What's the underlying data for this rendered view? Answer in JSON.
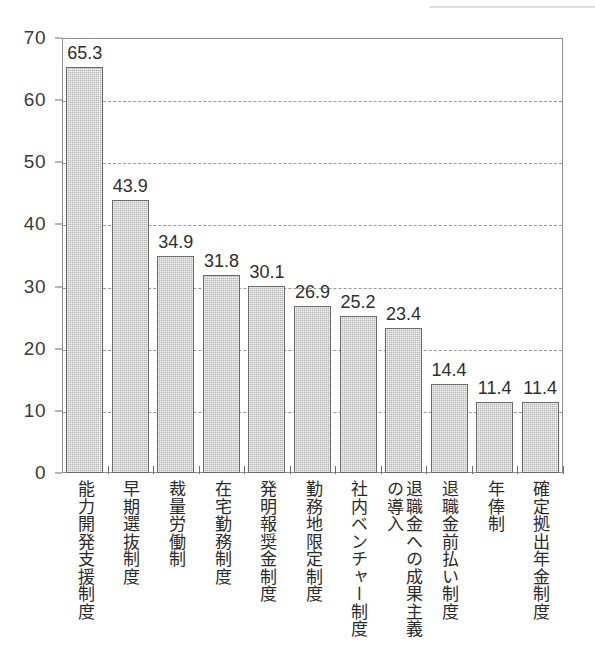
{
  "chart_data": {
    "type": "bar",
    "title": "",
    "subtitle": "",
    "xlabel": "",
    "ylabel": "",
    "ylim": [
      0,
      70
    ],
    "ytick_step": 10,
    "yticks": [
      "70",
      "60",
      "50",
      "40",
      "30",
      "20",
      "10",
      "0"
    ],
    "grid": true,
    "grid_style": "dashed-horizontal",
    "legend": false,
    "legend_position": "none",
    "orientation": "vertical",
    "bar_color": "#b4b4b4",
    "bar_border_color": "#6b6b6b",
    "axis_color": "#8e8e8e",
    "label_color": "#2b2b2b",
    "categories": [
      "能力開発支援制度",
      "早期選抜制度",
      "裁量労働制",
      "在宅勤務制度",
      "発明報奨金制度",
      "勤務地限定制度",
      "社内ベンチャー制度",
      "退職金への成果主義の導入",
      "退職金前払い制度",
      "年俸制",
      "確定拠出年金制度"
    ],
    "category_columns": [
      [
        "能力開発支援制度"
      ],
      [
        "早期選抜制度"
      ],
      [
        "裁量労働制"
      ],
      [
        "在宅勤務制度"
      ],
      [
        "発明報奨金制度"
      ],
      [
        "勤務地限定制度"
      ],
      [
        "社内ベンチャー制度"
      ],
      [
        "退職金への成果主義",
        "の導入"
      ],
      [
        "退職金前払い制度"
      ],
      [
        "年俸制"
      ],
      [
        "確定拠出年金制度"
      ]
    ],
    "values": [
      65.3,
      43.9,
      34.9,
      31.8,
      30.1,
      26.9,
      25.2,
      23.4,
      14.4,
      11.4,
      11.4
    ],
    "value_labels": [
      "65.3",
      "43.9",
      "34.9",
      "31.8",
      "30.1",
      "26.9",
      "25.2",
      "23.4",
      "14.4",
      "11.4",
      "11.4"
    ]
  }
}
